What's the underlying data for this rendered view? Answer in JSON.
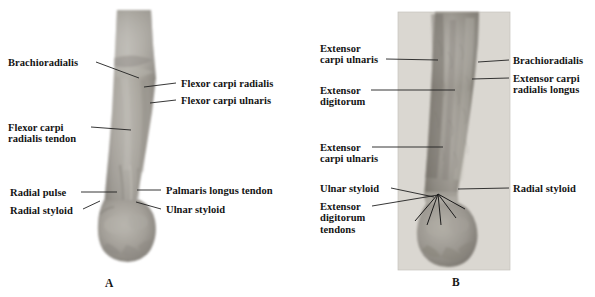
{
  "figure": {
    "width": 595,
    "height": 297,
    "type": "anatomy-photo-figure",
    "ink_color": "#141414",
    "leader_color": "#202020"
  },
  "panels": [
    {
      "id": "A",
      "letter": "A",
      "view": "anterior",
      "photo": {
        "name": "forearm-anterior-photo",
        "skin_light": "#b9b6b0",
        "skin_mid": "#9c9892",
        "skin_dark": "#7e7a74",
        "background": "#ffffff"
      },
      "labels": [
        {
          "key": "brachioradialis",
          "name": "label-brachioradialis",
          "lines": [
            "Brachioradialis"
          ],
          "side": "left",
          "x": 8,
          "y": 57,
          "leader": {
            "x1": 96,
            "y1": 62,
            "x2": 139,
            "y2": 78
          }
        },
        {
          "key": "flexor_carpi_radialis",
          "name": "label-flexor-carpi-radialis",
          "lines": [
            "Flexor carpi radialis"
          ],
          "side": "right",
          "x": 181,
          "y": 78,
          "leader": {
            "x1": 176,
            "y1": 83,
            "x2": 144,
            "y2": 87
          }
        },
        {
          "key": "flexor_carpi_ulnaris",
          "name": "label-flexor-carpi-ulnaris",
          "lines": [
            "Flexor carpi ulnaris"
          ],
          "side": "right",
          "x": 181,
          "y": 95,
          "leader": {
            "x1": 176,
            "y1": 100,
            "x2": 150,
            "y2": 103
          }
        },
        {
          "key": "flexor_carpi_radialis_tendon",
          "name": "label-flexor-carpi-radialis-tendon",
          "lines": [
            "Flexor carpi",
            "radialis tendon"
          ],
          "side": "left",
          "x": 8,
          "y": 122,
          "leader": {
            "x1": 91,
            "y1": 127,
            "x2": 131,
            "y2": 130
          }
        },
        {
          "key": "radial_pulse",
          "name": "label-radial-pulse",
          "lines": [
            "Radial pulse"
          ],
          "side": "left",
          "x": 10,
          "y": 187,
          "leader": {
            "x1": 81,
            "y1": 192,
            "x2": 117,
            "y2": 192
          }
        },
        {
          "key": "radial_styloid",
          "name": "label-radial-styloid",
          "lines": [
            "Radial styloid"
          ],
          "side": "left",
          "x": 10,
          "y": 205,
          "leader": {
            "x1": 83,
            "y1": 209,
            "x2": 100,
            "y2": 201
          }
        },
        {
          "key": "palmaris_longus_tendon",
          "name": "label-palmaris-longus-tendon",
          "lines": [
            "Palmaris longus tendon"
          ],
          "side": "right",
          "x": 166,
          "y": 185,
          "leader": {
            "x1": 161,
            "y1": 190,
            "x2": 137,
            "y2": 190
          }
        },
        {
          "key": "ulnar_styloid",
          "name": "label-ulnar-styloid",
          "lines": [
            "Ulnar styloid"
          ],
          "side": "right",
          "x": 166,
          "y": 204,
          "leader": {
            "x1": 161,
            "y1": 209,
            "x2": 136,
            "y2": 202
          }
        }
      ]
    },
    {
      "id": "B",
      "letter": "B",
      "view": "posterior",
      "photo": {
        "name": "forearm-posterior-photo",
        "skin_light": "#c2bfb8",
        "skin_mid": "#a09c95",
        "skin_dark": "#817d76",
        "background": "#dad7d1"
      },
      "labels": [
        {
          "key": "extensor_carpi_ulnaris_upper",
          "name": "label-extensor-carpi-ulnaris-upper",
          "lines": [
            "Extensor",
            "carpi ulnaris"
          ],
          "side": "left",
          "x": 320,
          "y": 43,
          "leader": {
            "x1": 386,
            "y1": 59,
            "x2": 438,
            "y2": 60
          }
        },
        {
          "key": "extensor_digitorum",
          "name": "label-extensor-digitorum",
          "lines": [
            "Extensor",
            "digitorum"
          ],
          "side": "left",
          "x": 320,
          "y": 85,
          "leader": {
            "x1": 371,
            "y1": 90,
            "x2": 455,
            "y2": 90
          }
        },
        {
          "key": "brachioradialis_b",
          "name": "label-brachioradialis-posterior",
          "lines": [
            "Brachioradialis"
          ],
          "side": "right",
          "x": 513,
          "y": 55,
          "leader": {
            "x1": 509,
            "y1": 60,
            "x2": 478,
            "y2": 62
          }
        },
        {
          "key": "extensor_carpi_radialis_longus",
          "name": "label-extensor-carpi-radialis-longus",
          "lines": [
            "Extensor carpi",
            "radialis longus"
          ],
          "side": "right",
          "x": 513,
          "y": 73,
          "leader": {
            "x1": 509,
            "y1": 78,
            "x2": 472,
            "y2": 79
          }
        },
        {
          "key": "extensor_carpi_ulnaris_lower",
          "name": "label-extensor-carpi-ulnaris-lower",
          "lines": [
            "Extensor",
            "carpi ulnaris"
          ],
          "side": "left",
          "x": 320,
          "y": 142,
          "leader": {
            "x1": 372,
            "y1": 147,
            "x2": 443,
            "y2": 147
          }
        },
        {
          "key": "ulnar_styloid_b",
          "name": "label-ulnar-styloid-posterior",
          "lines": [
            "Ulnar styloid"
          ],
          "side": "left",
          "x": 320,
          "y": 183,
          "leader": {
            "x1": 391,
            "y1": 188,
            "x2": 434,
            "y2": 197
          }
        },
        {
          "key": "radial_styloid_b",
          "name": "label-radial-styloid-posterior",
          "lines": [
            "Radial styloid"
          ],
          "side": "right",
          "x": 513,
          "y": 183,
          "leader": {
            "x1": 509,
            "y1": 188,
            "x2": 458,
            "y2": 189
          }
        },
        {
          "key": "extensor_digitorum_tendons",
          "name": "label-extensor-digitorum-tendons",
          "lines": [
            "Extensor",
            "digitorum",
            "tendons"
          ],
          "side": "left",
          "x": 320,
          "y": 201,
          "leader": {
            "x1": 372,
            "y1": 206,
            "x2": 438,
            "y2": 206
          }
        }
      ],
      "tendon_fan": {
        "name": "extensor-tendon-fan",
        "origin": {
          "x": 438,
          "y": 206
        },
        "tips": [
          {
            "x": 415,
            "y": 233
          },
          {
            "x": 427,
            "y": 237
          },
          {
            "x": 441,
            "y": 237
          },
          {
            "x": 456,
            "y": 230
          },
          {
            "x": 465,
            "y": 221
          }
        ]
      }
    }
  ]
}
